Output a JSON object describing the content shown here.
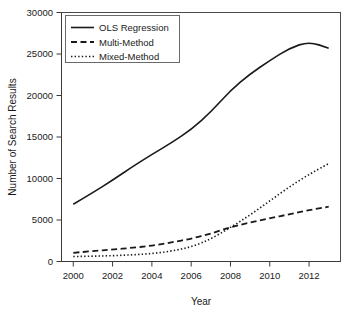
{
  "chart_data": {
    "type": "line",
    "title": "",
    "subtitle": "",
    "xlabel": "Year",
    "ylabel": "Number of Search Results",
    "x": [
      2000,
      2001,
      2002,
      2003,
      2004,
      2005,
      2006,
      2007,
      2008,
      2009,
      2010,
      2011,
      2012,
      2013
    ],
    "xlim": [
      1999.4,
      2013.6
    ],
    "ylim": [
      0,
      30000
    ],
    "xticks": [
      2000,
      2002,
      2004,
      2006,
      2008,
      2010,
      2012
    ],
    "xticklabels": [
      "2000",
      "2002",
      "2004",
      "2006",
      "2008",
      "2010",
      "2012"
    ],
    "yticks": [
      0,
      5000,
      10000,
      15000,
      20000,
      25000,
      30000
    ],
    "yticklabels": [
      "0",
      "5000",
      "10000",
      "15000",
      "20000",
      "25000",
      "30000"
    ],
    "grid": false,
    "legend_position": "top-left",
    "series": [
      {
        "name": "OLS Regression",
        "style": "solid",
        "color": "#1a1a1a",
        "values": [
          6900,
          8300,
          9800,
          11400,
          12900,
          14300,
          15900,
          18000,
          20600,
          22600,
          24200,
          25700,
          26500,
          25700
        ]
      },
      {
        "name": "Multi-Method",
        "style": "dashed",
        "color": "#1a1a1a",
        "values": [
          1050,
          1250,
          1450,
          1650,
          1900,
          2300,
          2750,
          3350,
          4150,
          4700,
          5200,
          5700,
          6200,
          6600
        ]
      },
      {
        "name": "Mixed-Method",
        "style": "dotted",
        "color": "#1a1a1a",
        "values": [
          600,
          640,
          700,
          800,
          950,
          1250,
          1750,
          2700,
          4100,
          5600,
          7300,
          9000,
          10500,
          11800
        ]
      }
    ]
  },
  "legend": {
    "entries": [
      {
        "label": "OLS Regression",
        "style": "solid"
      },
      {
        "label": "Multi-Method",
        "style": "dashed"
      },
      {
        "label": "Mixed-Method",
        "style": "dotted"
      }
    ]
  },
  "axes": {
    "x_title": "Year",
    "y_title": "Number of Search Results",
    "x_tick_labels": [
      "2000",
      "2002",
      "2004",
      "2006",
      "2008",
      "2010",
      "2012"
    ],
    "y_tick_labels": [
      "0",
      "5000",
      "10000",
      "15000",
      "20000",
      "25000",
      "30000"
    ]
  }
}
